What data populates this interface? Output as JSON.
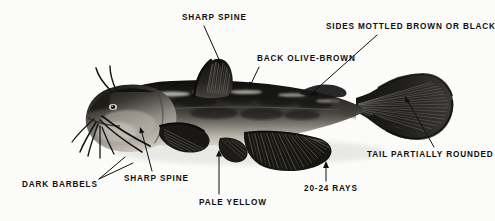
{
  "figure": {
    "background_color": "#fcfcfb",
    "label_color": "#101010",
    "image_type": "black-and-white photographic illustration"
  },
  "labels": [
    {
      "id": "sharp-spine-dorsal",
      "text": "SHARP SPINE",
      "x": 182,
      "y": 13,
      "points_to": "dorsal fin spine"
    },
    {
      "id": "sides-mottled",
      "text": "SIDES  MOTTLED BROWN OR BLACK",
      "x": 326,
      "y": 22,
      "points_to": "flank"
    },
    {
      "id": "back-olive-brown",
      "text": "BACK  OLIVE-BROWN",
      "x": 257,
      "y": 54,
      "points_to": "dorsal surface"
    },
    {
      "id": "tail-rounded",
      "text": "TAIL PARTIALLY ROUNDED",
      "x": 367,
      "y": 150,
      "points_to": "caudal fin"
    },
    {
      "id": "sharp-spine-pec",
      "text": "SHARP SPINE",
      "x": 124,
      "y": 174,
      "points_to": "pectoral fin spine"
    },
    {
      "id": "dark-barbels",
      "text": "DARK BARBELS",
      "x": 22,
      "y": 180,
      "points_to": "chin barbels"
    },
    {
      "id": "pale-yellow",
      "text": "PALE YELLOW",
      "x": 199,
      "y": 198,
      "points_to": "belly"
    },
    {
      "id": "rays-count",
      "text": "20-24 RAYS",
      "x": 304,
      "y": 184,
      "points_to": "anal fin rays"
    }
  ],
  "leader_lines": [
    {
      "id": "leader-sharp-spine-dorsal",
      "x1": 204,
      "y1": 26,
      "x2": 223,
      "y2": 67
    },
    {
      "id": "leader-sides-mottled",
      "x1": 375,
      "y1": 35,
      "x2": 310,
      "y2": 95
    },
    {
      "id": "leader-back-olive-brown",
      "x1": 258,
      "y1": 67,
      "x2": 249,
      "y2": 87
    },
    {
      "id": "leader-tail-rounded",
      "x1": 434,
      "y1": 148,
      "x2": 405,
      "y2": 97
    },
    {
      "id": "leader-sharp-spine-pec",
      "x1": 152,
      "y1": 172,
      "x2": 140,
      "y2": 127
    },
    {
      "id": "leader-dark-barbels-a",
      "x1": 98,
      "y1": 180,
      "x2": 124,
      "y2": 157
    },
    {
      "id": "leader-dark-barbels-b",
      "x1": 98,
      "y1": 180,
      "x2": 131,
      "y2": 162
    },
    {
      "id": "leader-pale-yellow",
      "x1": 219,
      "y1": 195,
      "x2": 219,
      "y2": 151
    },
    {
      "id": "leader-rays-count",
      "x1": 326,
      "y1": 181,
      "x2": 326,
      "y2": 163
    }
  ],
  "anatomy": {
    "body": "olive-brown elongate catfish body, lateral view facing left",
    "features": [
      "four pairs of dark barbels at mouth",
      "sharp pectoral spine",
      "sharp dorsal spine",
      "adipose fin",
      "anal fin with 20-24 rays",
      "partially rounded caudal fin"
    ]
  }
}
